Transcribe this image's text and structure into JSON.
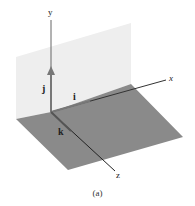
{
  "figure": {
    "caption": "(a)",
    "axes": {
      "x": "x",
      "y": "y",
      "z": "z"
    },
    "unit_vectors": {
      "i": "i",
      "j": "j",
      "k": "k"
    },
    "colors": {
      "wall": "#eeeeee",
      "floor": "#8a8a8a",
      "axis": "#333333",
      "vector": "#777777"
    }
  }
}
